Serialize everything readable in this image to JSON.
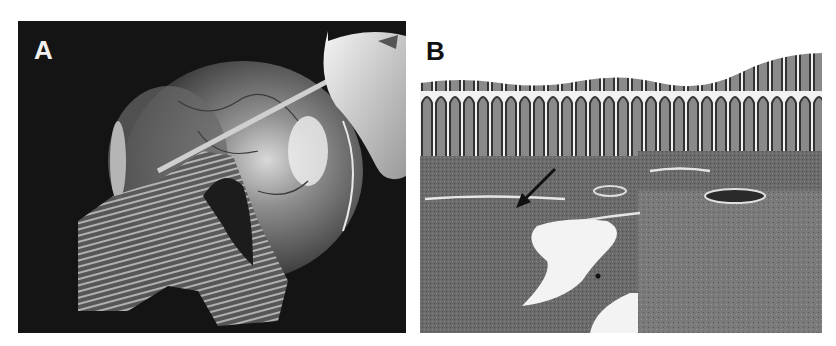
{
  "figure": {
    "panels": [
      {
        "id": "A",
        "label": "A",
        "content": "gross-specimen-photograph",
        "background_color": "#141414",
        "label_color": "#f2f2f2"
      },
      {
        "id": "B",
        "label": "B",
        "content": "histology-micrograph",
        "background_color": "#ffffff",
        "label_color": "#111111",
        "annotation": "arrow"
      }
    ]
  }
}
